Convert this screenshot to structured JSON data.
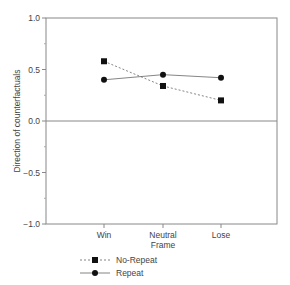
{
  "chart_data": {
    "type": "line",
    "title": "",
    "xlabel": "Frame",
    "ylabel": "Direction of counterfactuals",
    "categories": [
      "Win",
      "Neutral",
      "Lose"
    ],
    "ylim": [
      -1.0,
      1.0
    ],
    "yticks": [
      "1.0",
      "0.5",
      "0.0",
      "−0.5",
      "−1.0"
    ],
    "grid": false,
    "reference_line": 0.0,
    "legend_position": "bottom-left",
    "series": [
      {
        "name": "No-Repeat",
        "marker": "square",
        "line": "dashed",
        "values": [
          0.58,
          0.34,
          0.2
        ]
      },
      {
        "name": "Repeat",
        "marker": "circle",
        "line": "solid",
        "values": [
          0.4,
          0.45,
          0.42
        ]
      }
    ]
  },
  "legend": {
    "no_repeat": "No-Repeat",
    "repeat": "Repeat"
  }
}
